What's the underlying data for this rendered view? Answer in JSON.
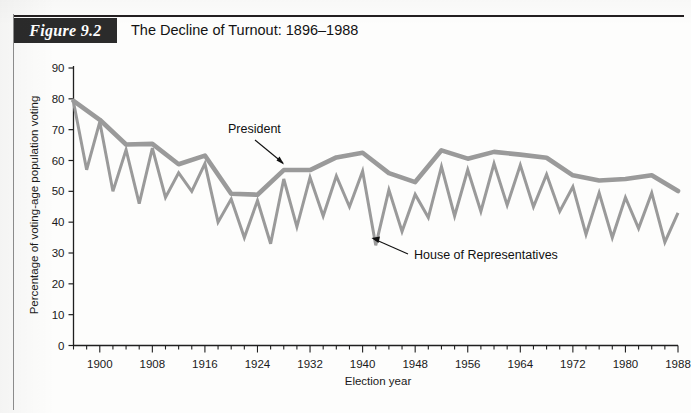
{
  "figure": {
    "tag": "Figure 9.2",
    "title": "The Decline of Turnout: 1896–1988"
  },
  "annotations": {
    "president_label": "President",
    "house_label": "House of Representatives"
  },
  "chart_data": {
    "type": "line",
    "title": "The Decline of Turnout: 1896–1988",
    "xlabel": "Election year",
    "ylabel": "Percentage of voting-age population voting",
    "xlim": [
      1896,
      1988
    ],
    "ylim": [
      0,
      90
    ],
    "ytick_values": [
      0,
      10,
      20,
      30,
      40,
      50,
      60,
      70,
      80,
      90
    ],
    "xtick_labels": [
      "1900",
      "1908",
      "1916",
      "1924",
      "1932",
      "1940",
      "1948",
      "1956",
      "1964",
      "1972",
      "1980",
      "1988"
    ],
    "xtick_label_years": [
      1900,
      1908,
      1916,
      1924,
      1932,
      1940,
      1948,
      1956,
      1964,
      1972,
      1980,
      1988
    ],
    "xtick_minor_step": 2,
    "grid": false,
    "legend": "annotated-inline",
    "line_color": "#9a9a9a",
    "series": [
      {
        "name": "President",
        "style": "thick",
        "x": [
          1896,
          1900,
          1904,
          1908,
          1912,
          1916,
          1920,
          1924,
          1928,
          1932,
          1936,
          1940,
          1944,
          1948,
          1952,
          1956,
          1960,
          1964,
          1968,
          1972,
          1976,
          1980,
          1984,
          1988
        ],
        "values": [
          79.3,
          73.2,
          65.2,
          65.4,
          58.8,
          61.6,
          49.2,
          48.9,
          56.9,
          56.9,
          61.0,
          62.5,
          55.9,
          53.0,
          63.3,
          60.6,
          62.8,
          61.9,
          60.9,
          55.2,
          53.5,
          54.0,
          55.2,
          50.1
        ]
      },
      {
        "name": "House of Representatives",
        "style": "thin",
        "x": [
          1896,
          1898,
          1900,
          1902,
          1904,
          1906,
          1908,
          1910,
          1912,
          1914,
          1916,
          1918,
          1920,
          1922,
          1924,
          1926,
          1928,
          1930,
          1932,
          1934,
          1936,
          1938,
          1940,
          1942,
          1944,
          1946,
          1948,
          1950,
          1952,
          1954,
          1956,
          1958,
          1960,
          1962,
          1964,
          1966,
          1968,
          1970,
          1972,
          1974,
          1976,
          1978,
          1980,
          1982,
          1984,
          1986,
          1988
        ],
        "values": [
          79.0,
          57.0,
          72.5,
          50.0,
          63.5,
          46.0,
          64.0,
          48.0,
          56.0,
          50.0,
          59.0,
          40.0,
          47.5,
          35.0,
          47.0,
          33.0,
          54.0,
          38.5,
          54.5,
          42.0,
          55.0,
          45.0,
          56.5,
          32.5,
          50.5,
          37.0,
          49.0,
          41.5,
          58.0,
          42.0,
          57.0,
          43.5,
          59.0,
          45.5,
          58.5,
          45.0,
          55.5,
          43.5,
          51.5,
          36.0,
          49.5,
          35.0,
          48.0,
          38.0,
          49.5,
          33.5,
          43.0
        ]
      }
    ]
  }
}
